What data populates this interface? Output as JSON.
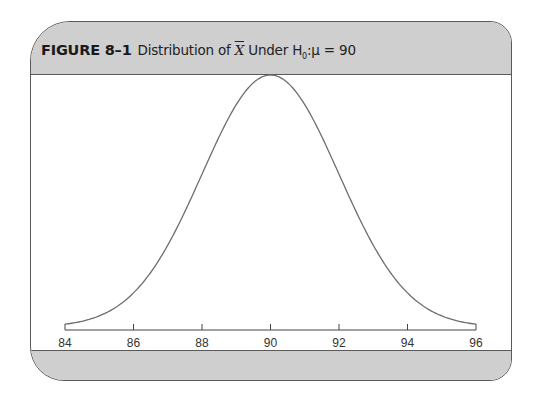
{
  "figure": {
    "label": "FIGURE 8–1",
    "caption_prefix": "Distribution of ",
    "caption_symbol": "X",
    "caption_suffix": " Under H",
    "caption_subscript": "0",
    "caption_tail": ":μ = 90"
  },
  "chart_data": {
    "type": "line",
    "distribution": {
      "family": "normal",
      "mean": 90,
      "sd": 2
    },
    "xlabel": "",
    "ylabel": "",
    "xlim": [
      84,
      96
    ],
    "x_ticks": [
      84,
      86,
      88,
      90,
      92,
      94,
      96
    ],
    "x_tick_labels": [
      "84",
      "86",
      "88",
      "90",
      "92",
      "94",
      "96"
    ],
    "x": [
      84,
      85,
      86,
      87,
      88,
      89,
      90,
      91,
      92,
      93,
      94,
      95,
      96
    ],
    "values": [
      0.0011,
      0.0088,
      0.027,
      0.0648,
      0.121,
      0.176,
      0.1995,
      0.176,
      0.121,
      0.0648,
      0.027,
      0.0088,
      0.0011
    ],
    "y_axis_shown": false,
    "grid": false,
    "legend": null,
    "colors": {
      "curve": "#6e6e6e",
      "axis": "#444444",
      "header_bg": "#cfcfcf",
      "border": "#5a5a5a"
    }
  }
}
